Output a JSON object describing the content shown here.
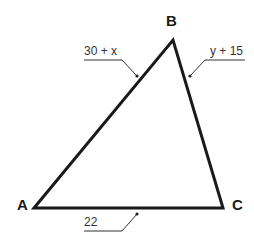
{
  "diagram": {
    "type": "triangle",
    "vertices": [
      {
        "name": "A",
        "x": 34,
        "y": 208
      },
      {
        "name": "B",
        "x": 173,
        "y": 40
      },
      {
        "name": "C",
        "x": 223,
        "y": 208
      }
    ],
    "sides": [
      {
        "segment": "AB",
        "label": "30 + x"
      },
      {
        "segment": "BC",
        "label": "y + 15"
      },
      {
        "segment": "AC",
        "label": "22"
      }
    ],
    "colors": {
      "stroke": "#1a1a1a",
      "leader": "#333333"
    }
  }
}
